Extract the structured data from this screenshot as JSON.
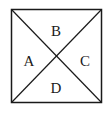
{
  "diagram": {
    "shape": "square with both diagonals",
    "stroke_color": "#1a1a1a",
    "regions": [
      {
        "id": "top",
        "label": "B"
      },
      {
        "id": "left",
        "label": "A"
      },
      {
        "id": "right",
        "label": "C"
      },
      {
        "id": "bottom",
        "label": "D"
      }
    ]
  }
}
